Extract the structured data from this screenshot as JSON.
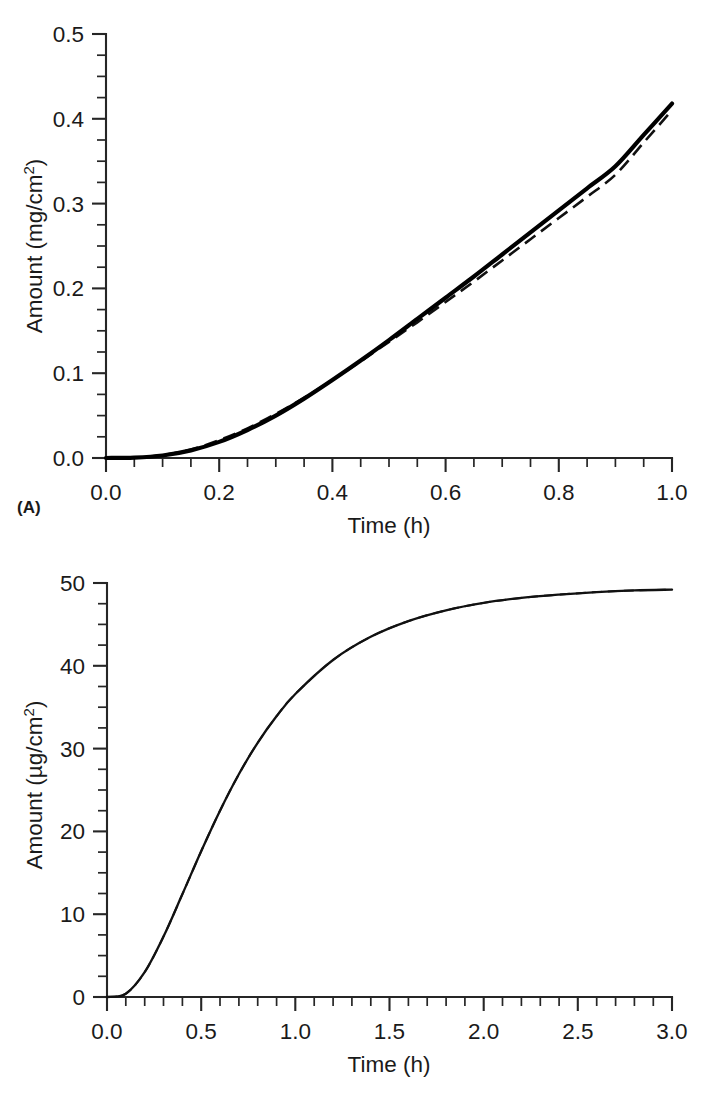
{
  "figure": {
    "panels": [
      {
        "tag": "(A)",
        "xlabel": "Time (h)",
        "ylabel_prefix": "Amount (mg/cm",
        "ylabel_sup": "2",
        "ylabel_suffix": ")",
        "ylabel_full": "Amount (mg/cm2)",
        "xticks": [
          "0.0",
          "0.2",
          "0.4",
          "0.6",
          "0.8",
          "1.0"
        ],
        "yticks": [
          "0.0",
          "0.1",
          "0.2",
          "0.3",
          "0.4",
          "0.5"
        ]
      },
      {
        "tag": "(B)",
        "xlabel": "Time (h)",
        "ylabel_prefix": "Amount (µg/cm",
        "ylabel_sup": "2",
        "ylabel_suffix": ")",
        "ylabel_full": "Amount (µg/cm2)",
        "xticks": [
          "0.0",
          "0.5",
          "1.0",
          "1.5",
          "2.0",
          "2.5",
          "3.0"
        ],
        "yticks": [
          "0",
          "10",
          "20",
          "30",
          "40",
          "50"
        ]
      }
    ]
  },
  "chart_data": [
    {
      "type": "line",
      "panel": "(A)",
      "title": "",
      "xlabel": "Time (h)",
      "ylabel": "Amount (mg/cm2)",
      "xlim": [
        0.0,
        1.0
      ],
      "ylim": [
        0.0,
        0.5
      ],
      "xticks": [
        0.0,
        0.2,
        0.4,
        0.6,
        0.8,
        1.0
      ],
      "yticks": [
        0.0,
        0.1,
        0.2,
        0.3,
        0.4,
        0.5
      ],
      "minor_tick_x_step": 0.05,
      "minor_tick_y_step": 0.025,
      "grid": false,
      "legend": "none",
      "x": [
        0.0,
        0.05,
        0.1,
        0.15,
        0.2,
        0.25,
        0.3,
        0.35,
        0.4,
        0.45,
        0.5,
        0.55,
        0.6,
        0.65,
        0.7,
        0.75,
        0.8,
        0.85,
        0.9,
        0.95,
        1.0
      ],
      "series": [
        {
          "name": "solid curve",
          "style": "solid",
          "values": [
            0.0,
            0.0005,
            0.003,
            0.009,
            0.019,
            0.033,
            0.05,
            0.07,
            0.092,
            0.115,
            0.139,
            0.164,
            0.189,
            0.214,
            0.24,
            0.266,
            0.292,
            0.318,
            0.344,
            0.381,
            0.418
          ]
        },
        {
          "name": "dashed curve",
          "style": "dashed",
          "values": [
            0.0,
            0.0006,
            0.0035,
            0.01,
            0.021,
            0.035,
            0.052,
            0.071,
            0.092,
            0.114,
            0.137,
            0.16,
            0.184,
            0.208,
            0.233,
            0.258,
            0.283,
            0.308,
            0.334,
            0.372,
            0.41
          ]
        }
      ]
    },
    {
      "type": "line",
      "panel": "(B)",
      "title": "",
      "xlabel": "Time (h)",
      "ylabel": "Amount (µg/cm2)",
      "xlim": [
        0.0,
        3.0
      ],
      "ylim": [
        0,
        50
      ],
      "xticks": [
        0.0,
        0.5,
        1.0,
        1.5,
        2.0,
        2.5,
        3.0
      ],
      "yticks": [
        0,
        10,
        20,
        30,
        40,
        50
      ],
      "minor_tick_x_step": 0.1,
      "minor_tick_y_step": 2.5,
      "grid": false,
      "legend": "none",
      "x": [
        0.0,
        0.1,
        0.2,
        0.3,
        0.4,
        0.5,
        0.6,
        0.7,
        0.8,
        0.9,
        1.0,
        1.2,
        1.4,
        1.6,
        1.8,
        2.0,
        2.2,
        2.4,
        2.6,
        2.8,
        3.0
      ],
      "series": [
        {
          "name": "solid curve",
          "style": "solid",
          "values": [
            0.0,
            0.4,
            3.0,
            7.3,
            12.4,
            17.6,
            22.5,
            26.9,
            30.7,
            33.9,
            36.6,
            40.7,
            43.5,
            45.4,
            46.7,
            47.6,
            48.2,
            48.6,
            48.9,
            49.1,
            49.2
          ]
        },
        {
          "name": "dashed curve",
          "style": "dashed",
          "values": [
            0.0,
            0.4,
            3.0,
            7.3,
            12.4,
            17.6,
            22.5,
            26.9,
            30.7,
            33.9,
            36.6,
            40.7,
            43.5,
            45.4,
            46.7,
            47.6,
            48.2,
            48.6,
            48.9,
            49.1,
            49.2
          ]
        }
      ]
    }
  ]
}
